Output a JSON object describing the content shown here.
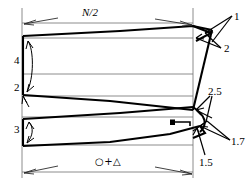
{
  "figure": {
    "background_color": "#ffffff",
    "ink_color": "#000000",
    "thin_rule_color": "#6f6f6f",
    "width": 252,
    "height": 187,
    "dimensions": {
      "top_span_label": "N/2",
      "bottom_span_label": "○+△"
    },
    "callouts": [
      {
        "id": "callout-4",
        "text": "4",
        "x": 14,
        "y": 55,
        "side": "left"
      },
      {
        "id": "callout-2a",
        "text": "2",
        "x": 14,
        "y": 82,
        "side": "left"
      },
      {
        "id": "callout-3",
        "text": "3",
        "x": 14,
        "y": 124,
        "side": "left"
      },
      {
        "id": "callout-1",
        "text": "1",
        "x": 234,
        "y": 11,
        "side": "right"
      },
      {
        "id": "callout-2b",
        "text": "2",
        "x": 224,
        "y": 43,
        "side": "right"
      },
      {
        "id": "callout-25",
        "text": "2.5",
        "x": 208,
        "y": 86,
        "side": "right"
      },
      {
        "id": "callout-17",
        "text": "1.7",
        "x": 231,
        "y": 136,
        "side": "right"
      },
      {
        "id": "callout-15",
        "text": "1.5",
        "x": 199,
        "y": 157,
        "side": "right"
      }
    ]
  }
}
